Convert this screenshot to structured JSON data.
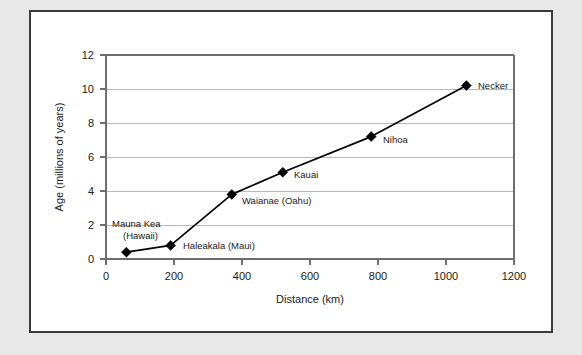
{
  "figure": {
    "background_color": "#e8e8e8",
    "panel_color": "#ffffff",
    "border_color": "#3a3a3a"
  },
  "chart_data": {
    "type": "line",
    "title": "",
    "xlabel": "Distance (km)",
    "ylabel": "Age (millions of years)",
    "xlim": [
      0,
      1200
    ],
    "ylim": [
      0,
      12
    ],
    "xticks": [
      0,
      200,
      400,
      600,
      800,
      1000,
      1200
    ],
    "yticks": [
      0,
      2,
      4,
      6,
      8,
      10,
      12
    ],
    "xtick_labels": [
      "0",
      "200",
      "400",
      "600",
      "800",
      "1000",
      "1200"
    ],
    "ytick_labels": [
      "0",
      "2",
      "4",
      "6",
      "8",
      "10",
      "12"
    ],
    "grid": "horizontal",
    "legend": "none",
    "marker": "diamond",
    "line_color": "#000000",
    "marker_color": "#000000",
    "x": [
      60,
      190,
      370,
      520,
      780,
      1060
    ],
    "values": [
      0.4,
      0.8,
      3.8,
      5.1,
      7.2,
      10.2
    ],
    "point_labels": [
      "Mauna Kea",
      "(Hawaii)",
      "Haleakala (Maui)",
      "Waianae (Oahu)",
      "Kauai",
      "Nihoa",
      "Necker"
    ],
    "annotations": [
      {
        "name": "mauna-kea",
        "label_line1": "Mauna Kea",
        "label_line2": "(Hawaii)",
        "x": 60,
        "y": 0.4
      },
      {
        "name": "haleakala",
        "label_line1": "Haleakala (Maui)",
        "label_line2": "",
        "x": 190,
        "y": 0.8
      },
      {
        "name": "waianae",
        "label_line1": "Waianae (Oahu)",
        "label_line2": "",
        "x": 370,
        "y": 3.8
      },
      {
        "name": "kauai",
        "label_line1": "Kauai",
        "label_line2": "",
        "x": 520,
        "y": 5.1
      },
      {
        "name": "nihoa",
        "label_line1": "Nihoa",
        "label_line2": "",
        "x": 780,
        "y": 7.2
      },
      {
        "name": "necker",
        "label_line1": "Necker",
        "label_line2": "",
        "x": 1060,
        "y": 10.2
      }
    ]
  }
}
